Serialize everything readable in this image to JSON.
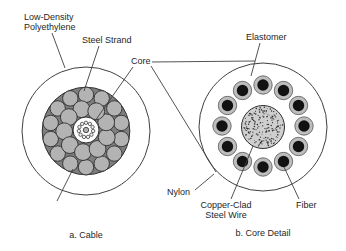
{
  "figure": {
    "captions": {
      "cable": "a. Cable",
      "core_detail": "b. Core Detail"
    }
  },
  "labels": {
    "low_density_line1": "Low-Density",
    "low_density_line2": "Polyethylene",
    "steel_strand": "Steel Strand",
    "core": "Core",
    "elastomer": "Elastomer",
    "copper_tube": "Copper Tube",
    "nylon": "Nylon",
    "copper_clad_line1": "Copper-Clad",
    "copper_clad_line2": "Steel Wire",
    "fiber": "Fiber"
  },
  "colors": {
    "background": "#ffffff",
    "line": "#3f3f3f",
    "text": "#262626",
    "strand_fill": "#b3b3b3",
    "strand_gap": "#7e7e7e",
    "stroke_dark": "#2f2f2f",
    "wire_ring": "#bdbdbd",
    "wire_core": "#121212",
    "fiber_ring_fill": "#f0f0f0",
    "king_wire_fill": "#b0b0b0",
    "stipple_fill": "#cfcfcf",
    "stipple_dot": "#2a2a2a"
  },
  "diagram_counts": {
    "steel_strands_outer": 14,
    "steel_strands_inner": 9,
    "tube_fibers": 11,
    "core_wires": 12
  }
}
